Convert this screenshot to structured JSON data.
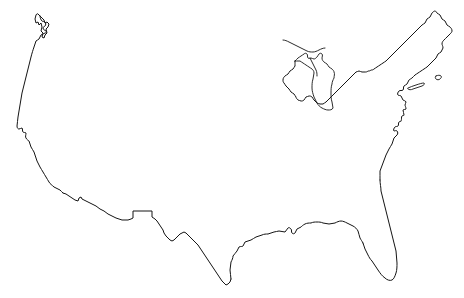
{
  "figure": {
    "style": "blank outline map",
    "projection_note": "",
    "caption": ""
  },
  "canvas": {
    "width": 464,
    "height": 298,
    "background_color": "#ffffff"
  },
  "stroke": {
    "color": "#141414",
    "width": 1,
    "fill": "none"
  },
  "map_features": {
    "mainland_label": "Contiguous United States landmass outline",
    "great_lakes_label": "Great Lakes shoreline",
    "long_island_label": "Long Island",
    "cape_cod_label": "Cape Cod"
  },
  "chart_data": {
    "type": "map",
    "region": "United States (lower 48)",
    "grid": false,
    "legend": null,
    "xlabel": "",
    "ylabel": "",
    "shapes": [
      {
        "name": "mainland",
        "kind": "outline",
        "closed": true,
        "path": "M 37,36 L 40,30 L 43,33 L 44,41 L 46,45 L 49,42 L 51,45 L 50,52 L 47,56 L 44,54 L 42,57 L 41,53 L 38,56 L 36,52 L 34,47 L 33,41 Z"
      },
      {
        "name": "pacific-northwest-coast",
        "kind": "coastline",
        "closed": false
      },
      {
        "name": "california-coast",
        "kind": "coastline",
        "closed": false
      },
      {
        "name": "mexico-border",
        "kind": "border",
        "closed": false
      },
      {
        "name": "gulf-coast",
        "kind": "coastline",
        "closed": false
      },
      {
        "name": "florida-peninsula",
        "kind": "coastline",
        "closed": false
      },
      {
        "name": "atlantic-coast",
        "kind": "coastline",
        "closed": false
      },
      {
        "name": "new-england-maine",
        "kind": "coastline",
        "closed": false
      },
      {
        "name": "canada-border-north",
        "kind": "border",
        "closed": false
      },
      {
        "name": "great-lakes",
        "kind": "lakeshore",
        "closed": false
      }
    ],
    "bounds": {
      "left_px": 15,
      "right_px": 452,
      "top_px": 11,
      "bottom_px": 285
    }
  }
}
